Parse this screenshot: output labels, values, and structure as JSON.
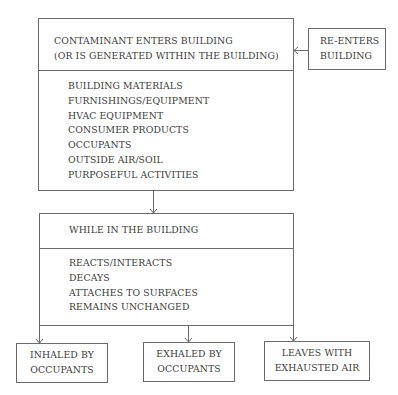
{
  "diagram": {
    "source_box": {
      "title_line1": "CONTAMINANT ENTERS BUILDING",
      "title_line2": "(OR IS GENERATED WITHIN THE BUILDING)",
      "sources": [
        "BUILDING MATERIALS",
        "FURNISHINGS/EQUIPMENT",
        "HVAC EQUIPMENT",
        "CONSUMER PRODUCTS",
        "OCCUPANTS",
        "OUTSIDE AIR/SOIL",
        "PURPOSEFUL ACTIVITIES"
      ]
    },
    "reenter_box": {
      "line1": "RE-ENTERS",
      "line2": "BUILDING"
    },
    "process_box": {
      "title": "WHILE IN THE BUILDING",
      "processes": [
        "REACTS/INTERACTS",
        "DECAYS",
        "ATTACHES TO SURFACES",
        "REMAINS UNCHANGED"
      ]
    },
    "outcomes": [
      {
        "line1": "INHALED BY",
        "line2": "OCCUPANTS"
      },
      {
        "line1": "EXHALED BY",
        "line2": "OCCUPANTS"
      },
      {
        "line1": "LEAVES WITH",
        "line2": "EXHAUSTED AIR"
      }
    ]
  }
}
